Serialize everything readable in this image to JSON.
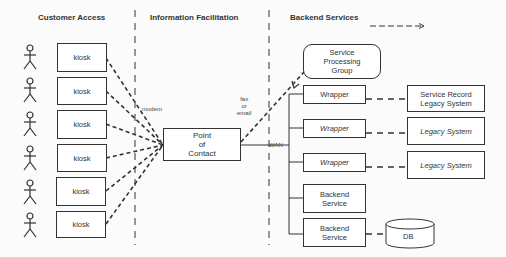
{
  "headers": {
    "customer_access": "Customer Access",
    "information_facilitation": "Information Facilitation",
    "backend_services": "Backend Services"
  },
  "kiosks": [
    {
      "label": "kiosk"
    },
    {
      "label": "kiosk"
    },
    {
      "label": "kiosk"
    },
    {
      "label": "kiosk"
    },
    {
      "label": "kiosk"
    },
    {
      "label": "kiosk"
    }
  ],
  "point_of_contact": "Point\nof\nContact",
  "service_processing_group": "Service\nProcessing\nGroup",
  "wrappers": [
    {
      "label": "Wrapper",
      "italic": false
    },
    {
      "label": "Wrapper",
      "italic": true
    },
    {
      "label": "Wrapper",
      "italic": true
    }
  ],
  "legacy_systems": [
    {
      "label": "Service Record\nLegacy System",
      "italic": false
    },
    {
      "label": "Legacy System",
      "italic": true
    },
    {
      "label": "Legacy System",
      "italic": true
    }
  ],
  "backend_services": [
    {
      "label": "Backend\nService"
    },
    {
      "label": "Backend\nService"
    }
  ],
  "database": "DB",
  "connection_labels": {
    "modem": "modem",
    "fax_or_email": "fax\nor\nemail",
    "wan": "WAN"
  }
}
